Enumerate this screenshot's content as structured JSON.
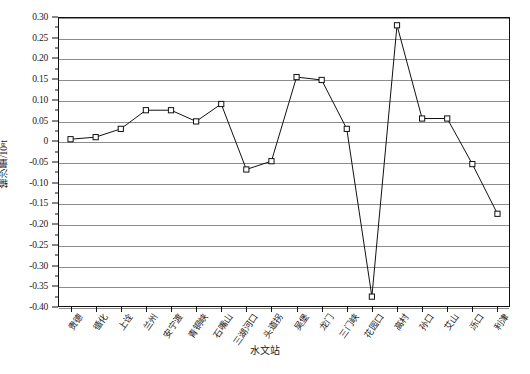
{
  "chart_data": {
    "type": "line",
    "title": "",
    "xlabel": "水文站",
    "ylabel": "输沙量/10⁸t",
    "ylim": [
      -0.4,
      0.3
    ],
    "ytick_step": 0.05,
    "grid": true,
    "legend": "none",
    "marker": "open-square",
    "line_color": "#111111",
    "grid_color": "#8d8d8d",
    "categories": [
      "贵德",
      "循化",
      "上诠",
      "兰州",
      "安宁渡",
      "青铜峡",
      "石嘴山",
      "三湖河口",
      "头道拐",
      "吴堡",
      "龙门",
      "三门峡",
      "花园口",
      "高村",
      "孙口",
      "艾山",
      "泺口",
      "利津"
    ],
    "values": [
      0.005,
      0.01,
      0.03,
      0.075,
      0.075,
      0.048,
      0.09,
      -0.068,
      -0.048,
      0.155,
      0.148,
      0.03,
      -0.375,
      0.28,
      0.055,
      0.055,
      -0.055,
      -0.175
    ],
    "yticks": [
      "0.30",
      "0.25",
      "0.20",
      "0.15",
      "0.10",
      "0.05",
      "0",
      "-0.05",
      "-0.10",
      "-0.15",
      "-0.20",
      "-0.25",
      "-0.30",
      "-0.35",
      "-0.40"
    ],
    "ytick_values": [
      0.3,
      0.25,
      0.2,
      0.15,
      0.1,
      0.05,
      0,
      -0.05,
      -0.1,
      -0.15,
      -0.2,
      -0.25,
      -0.3,
      -0.35,
      -0.4
    ]
  }
}
